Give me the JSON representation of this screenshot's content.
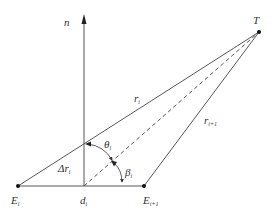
{
  "diagram": {
    "colors": {
      "line": "#444444",
      "text": "#333333",
      "background": "#ffffff"
    },
    "labels": {
      "normal": "n",
      "target": "T",
      "ri_main": "r",
      "ri_sub": "i",
      "ri1_main": "r",
      "ri1_sub": "i+1",
      "theta_main": "θ",
      "theta_sub": "i",
      "beta_main": "β",
      "beta_sub": "i",
      "delta_r_main": "Δr",
      "delta_r_sub": "i",
      "ei_main": "E",
      "ei_sub": "i",
      "di_main": "d",
      "di_sub": "i",
      "ei1_main": "E",
      "ei1_sub": "i+1"
    },
    "points": {
      "T": [
        259,
        32
      ],
      "E_i": [
        18,
        186
      ],
      "d_i": [
        84,
        186
      ],
      "E_i+1": [
        144,
        186
      ],
      "normal_top": [
        84,
        16
      ]
    }
  }
}
